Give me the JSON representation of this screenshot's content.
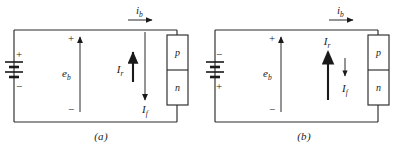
{
  "figure": {
    "type": "circuit-diagram",
    "panels": [
      {
        "id": "a",
        "caption": "(a)",
        "battery": {
          "top_terminal": "+",
          "bottom_terminal": "−",
          "polarity": "positive-up"
        },
        "source_arrow": {
          "label": "e",
          "subscript": "b",
          "direction": "up",
          "plus_sign": "+",
          "minus_sign": "−"
        },
        "loop_current": {
          "label": "i",
          "subscript": "b",
          "direction": "right",
          "position": "top-rail"
        },
        "branch_currents": [
          {
            "label": "I",
            "subscript": "r",
            "direction": "up",
            "magnitude": "small"
          },
          {
            "label": "I",
            "subscript": "f",
            "direction": "down",
            "magnitude": "large"
          }
        ],
        "device": {
          "type": "pn-junction",
          "top_region": "p",
          "bottom_region": "n"
        }
      },
      {
        "id": "b",
        "caption": "(b)",
        "battery": {
          "top_terminal": "−",
          "bottom_terminal": "+",
          "polarity": "negative-up"
        },
        "source_arrow": {
          "label": "e",
          "subscript": "b",
          "direction": "up",
          "plus_sign": "+",
          "minus_sign": "−"
        },
        "loop_current": {
          "label": "i",
          "subscript": "b",
          "direction": "right",
          "position": "top-rail"
        },
        "branch_currents": [
          {
            "label": "I",
            "subscript": "r",
            "direction": "up",
            "magnitude": "large"
          },
          {
            "label": "I",
            "subscript": "f",
            "direction": "down",
            "magnitude": "small"
          }
        ],
        "device": {
          "type": "pn-junction",
          "top_region": "p",
          "bottom_region": "n"
        }
      }
    ],
    "colors": {
      "line": "#2b2b2b",
      "text": "#1a1a1a",
      "background": "#ffffff"
    }
  }
}
